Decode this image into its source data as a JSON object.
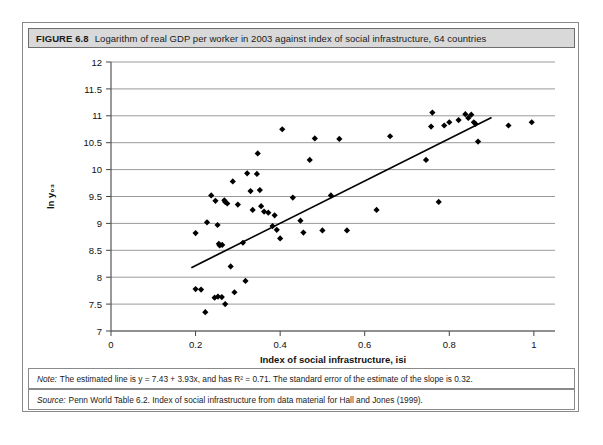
{
  "figure": {
    "label": "FIGURE 6.8",
    "caption": "Logarithm of real GDP per worker in 2003 against index of social infrastructure, 64 countries",
    "note_lead": "Note:",
    "note_text": "The estimated line is y = 7.43 + 3.93x, and has R² = 0.71. The standard error of the estimate of the slope is 0.32.",
    "source_lead": "Source:",
    "source_text": "Penn World Table 6.2. Index of social infrastructure from data material for Hall and Jones (1999)."
  },
  "chart_data": {
    "type": "scatter",
    "title": "Logarithm of real GDP per worker in 2003 against index of social infrastructure, 64 countries",
    "xlabel": "Index of social infrastructure, isi",
    "ylabel": "ln y₀₃",
    "xlim": [
      0,
      1.05
    ],
    "ylim": [
      7,
      12
    ],
    "xticks": [
      0,
      0.2,
      0.4,
      0.6,
      0.8,
      1
    ],
    "xtick_labels": [
      "0",
      "0.2",
      "0.4",
      "0.6",
      "0.8",
      "1"
    ],
    "yticks": [
      7,
      7.5,
      8,
      8.5,
      9,
      9.5,
      10,
      10.5,
      11,
      11.5,
      12
    ],
    "ytick_labels": [
      "7",
      "7.5",
      "8",
      "8.5",
      "9",
      "9.5",
      "10",
      "10.5",
      "11",
      "11.5",
      "12"
    ],
    "grid": "horizontal",
    "legend": "none",
    "marker": "diamond",
    "marker_color": "#000000",
    "line_color": "#000000",
    "grid_color": "#9a9a9a",
    "axis_color": "#555555",
    "fit_line": {
      "label": "OLS regression line",
      "intercept": 7.43,
      "slope": 3.93,
      "r_squared": 0.71,
      "slope_std_error": 0.32,
      "x_start": 0.19,
      "x_end": 0.9
    },
    "points": [
      [
        0.2,
        7.78
      ],
      [
        0.213,
        7.77
      ],
      [
        0.223,
        7.35
      ],
      [
        0.245,
        7.62
      ],
      [
        0.253,
        7.64
      ],
      [
        0.262,
        7.63
      ],
      [
        0.27,
        7.5
      ],
      [
        0.292,
        7.72
      ],
      [
        0.2,
        8.82
      ],
      [
        0.227,
        9.02
      ],
      [
        0.237,
        9.52
      ],
      [
        0.247,
        9.42
      ],
      [
        0.252,
        8.97
      ],
      [
        0.255,
        8.62
      ],
      [
        0.257,
        8.59
      ],
      [
        0.263,
        8.6
      ],
      [
        0.268,
        9.43
      ],
      [
        0.27,
        9.4
      ],
      [
        0.275,
        9.37
      ],
      [
        0.283,
        8.2
      ],
      [
        0.288,
        9.78
      ],
      [
        0.3,
        9.35
      ],
      [
        0.312,
        8.64
      ],
      [
        0.318,
        7.93
      ],
      [
        0.322,
        9.93
      ],
      [
        0.33,
        9.6
      ],
      [
        0.335,
        9.25
      ],
      [
        0.345,
        9.92
      ],
      [
        0.347,
        10.3
      ],
      [
        0.352,
        9.62
      ],
      [
        0.355,
        9.32
      ],
      [
        0.362,
        9.22
      ],
      [
        0.372,
        9.2
      ],
      [
        0.382,
        8.95
      ],
      [
        0.387,
        9.15
      ],
      [
        0.392,
        8.88
      ],
      [
        0.4,
        8.72
      ],
      [
        0.405,
        10.75
      ],
      [
        0.43,
        9.48
      ],
      [
        0.448,
        9.05
      ],
      [
        0.455,
        8.83
      ],
      [
        0.47,
        10.18
      ],
      [
        0.482,
        10.58
      ],
      [
        0.5,
        8.87
      ],
      [
        0.52,
        9.52
      ],
      [
        0.54,
        10.57
      ],
      [
        0.558,
        8.87
      ],
      [
        0.628,
        9.25
      ],
      [
        0.66,
        10.62
      ],
      [
        0.745,
        10.18
      ],
      [
        0.757,
        10.8
      ],
      [
        0.76,
        11.06
      ],
      [
        0.775,
        9.4
      ],
      [
        0.788,
        10.82
      ],
      [
        0.8,
        10.88
      ],
      [
        0.822,
        10.92
      ],
      [
        0.838,
        11.03
      ],
      [
        0.845,
        10.96
      ],
      [
        0.852,
        11.02
      ],
      [
        0.858,
        10.88
      ],
      [
        0.862,
        10.85
      ],
      [
        0.868,
        10.52
      ],
      [
        0.94,
        10.82
      ],
      [
        0.995,
        10.88
      ]
    ]
  }
}
